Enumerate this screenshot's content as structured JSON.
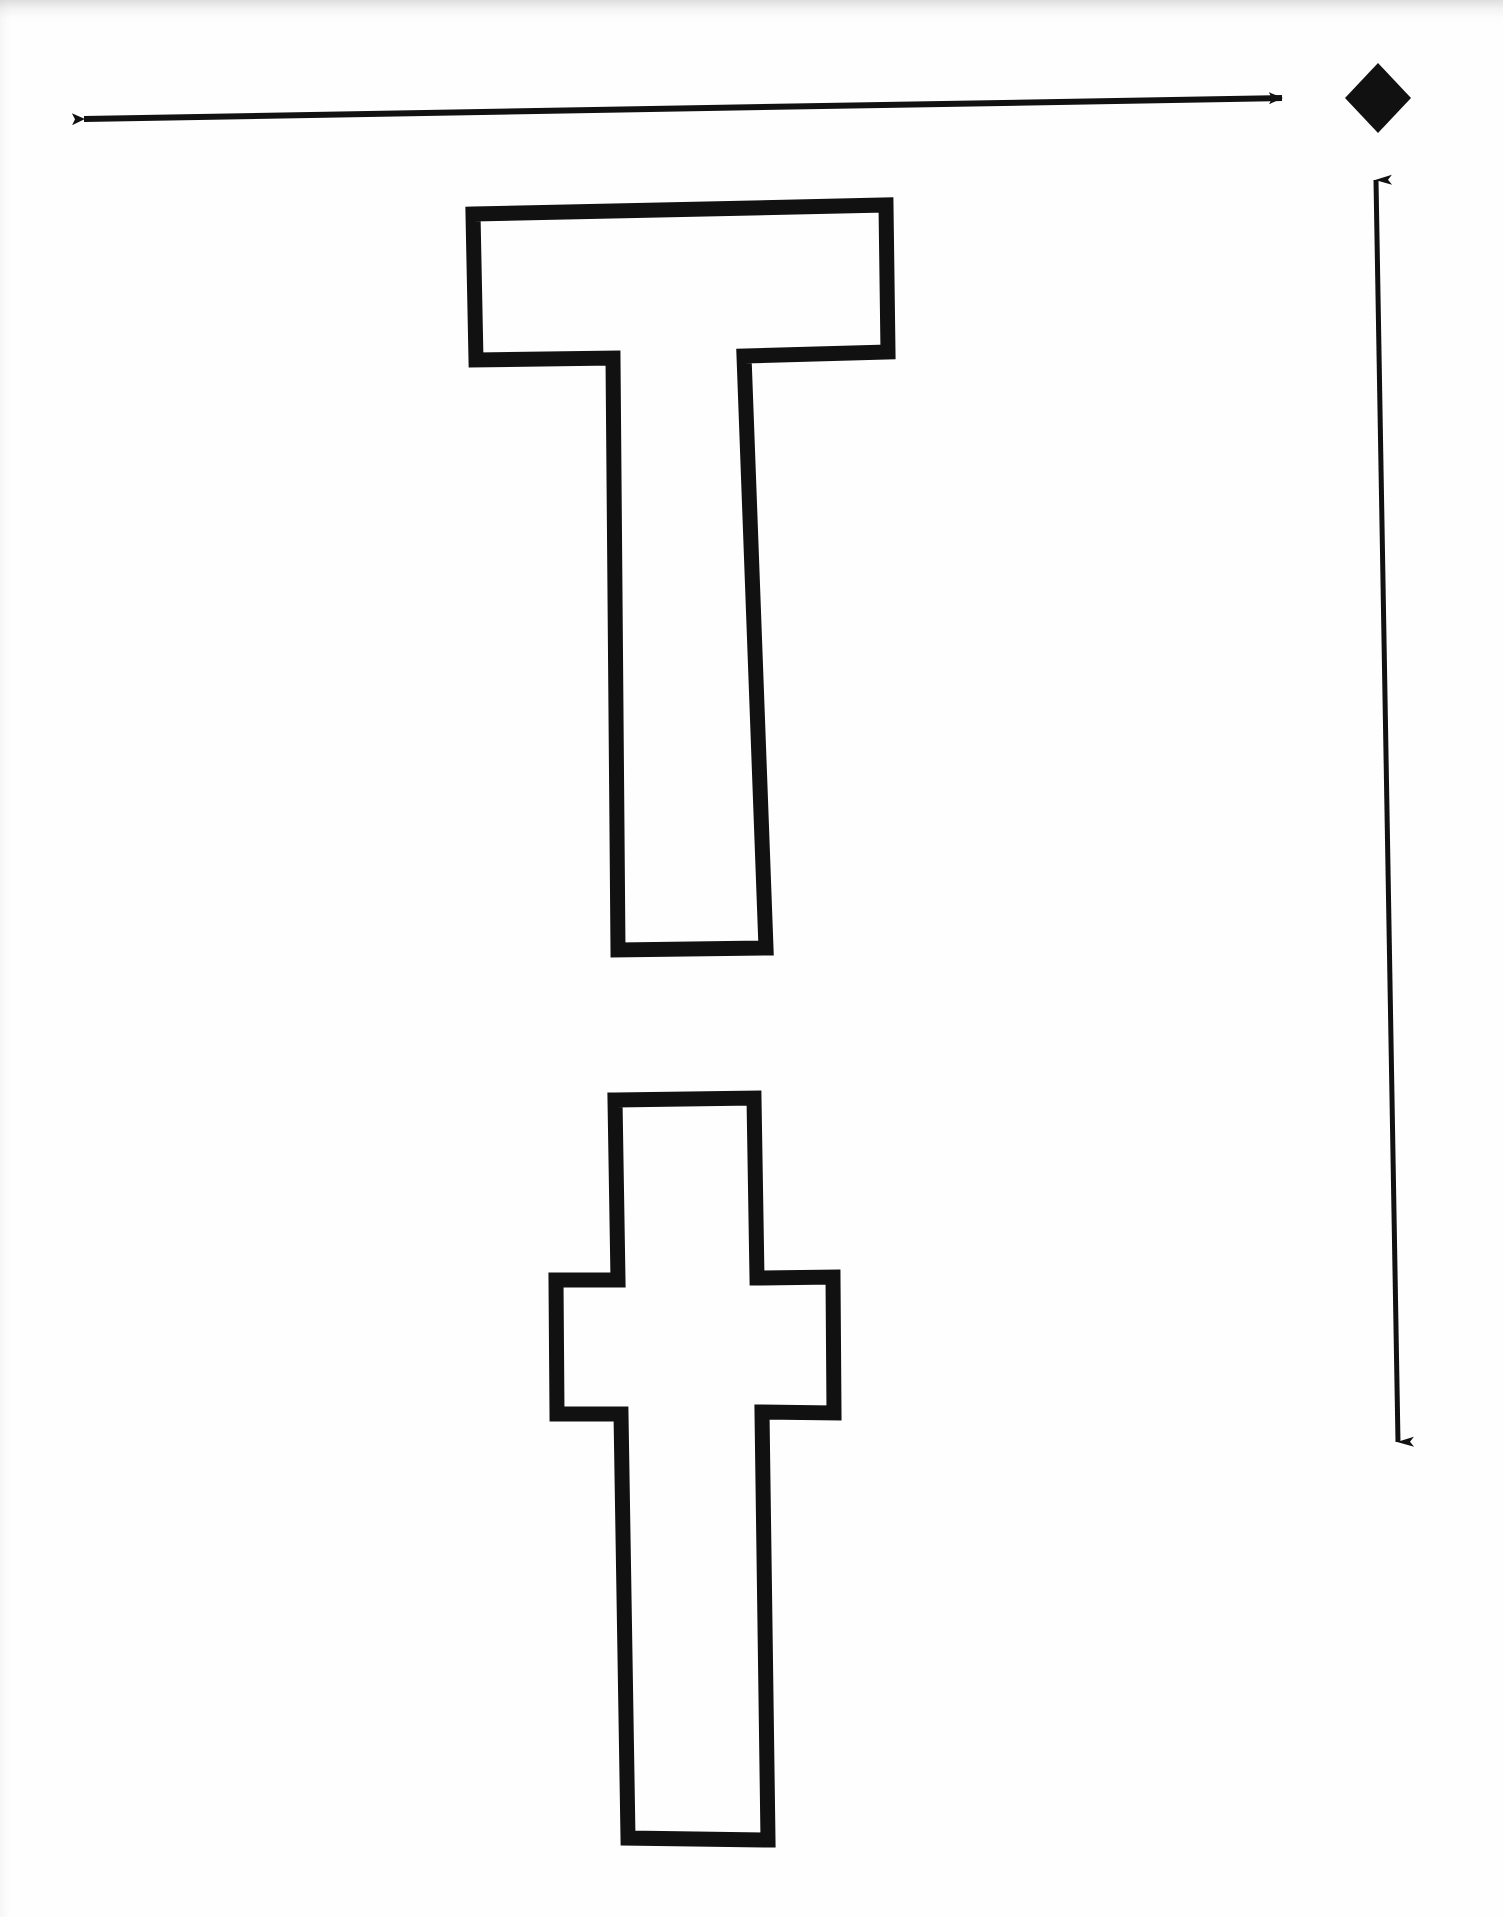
{
  "document": {
    "kind": "letter-tracing-worksheet",
    "title": "Letter T tracing worksheet",
    "background_color": "#fefefe",
    "ink_color": "#111111",
    "page_width": 1503,
    "page_height": 1917
  },
  "shapes": {
    "uppercase_t": {
      "name": "uppercase-letter-t",
      "label": "T",
      "outline_only": true,
      "stroke_color": "#111111",
      "stroke_width": 15,
      "fill": "none",
      "bounds": {
        "x": 473,
        "y": 212,
        "width": 415,
        "height": 738
      },
      "points": "473,214 886,205 888,352 744,356 766,948 618,950 613,358 476,360"
    },
    "lowercase_t": {
      "name": "lowercase-letter-t",
      "label": "t",
      "outline_only": true,
      "stroke_color": "#111111",
      "stroke_width": 15,
      "fill": "none",
      "bounds": {
        "x": 556,
        "y": 1100,
        "width": 278,
        "height": 740
      },
      "points": "615,1100 754,1098 757,1278 833,1277 834,1413 762,1412 768,1840 628,1838 621,1414 557,1414 556,1280 618,1280"
    },
    "width_arrow": {
      "name": "horizontal-width-arrow",
      "orientation": "horizontal",
      "double_headed": true,
      "color": "#111111",
      "x1": 74,
      "y1": 120,
      "x2": 1292,
      "y2": 97
    },
    "height_arrow": {
      "name": "vertical-height-arrow",
      "orientation": "vertical",
      "double_headed": true,
      "color": "#111111",
      "x1": 1376,
      "y1": 167,
      "x2": 1399,
      "y2": 1456
    },
    "diamond_marker": {
      "name": "diamond-marker",
      "color": "#111111",
      "center_x": 1378,
      "center_y": 98,
      "half_width": 33,
      "half_height": 35
    }
  },
  "legend": {
    "width_arrow_label": "",
    "height_arrow_label": "",
    "diamond_label": ""
  }
}
